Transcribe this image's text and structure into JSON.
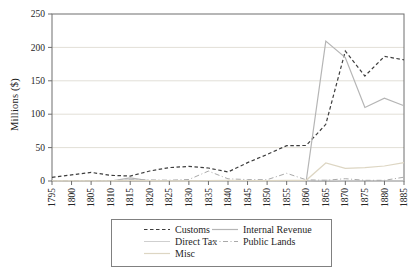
{
  "chart_data": {
    "type": "line",
    "title": "",
    "xlabel": "",
    "ylabel": "Millions ($)",
    "ylim": [
      0,
      250
    ],
    "y_ticks": [
      0,
      50,
      100,
      150,
      200,
      250
    ],
    "x": [
      1795,
      1800,
      1805,
      1810,
      1815,
      1820,
      1825,
      1830,
      1835,
      1840,
      1845,
      1850,
      1855,
      1860,
      1865,
      1870,
      1875,
      1880,
      1885
    ],
    "grid": "horizontal-light",
    "legend_position": "bottom-boxed",
    "axis_color": "#6e6e6e",
    "grid_color": "#e2dfd7",
    "text_color": "#262626",
    "series": [
      {
        "name": "Customs",
        "color": "#3d3d3d",
        "dash": "3.5 2.5",
        "width": 1.2,
        "values": [
          5.6,
          9.1,
          12.9,
          8.6,
          7.3,
          15.0,
          20.1,
          21.9,
          19.4,
          13.5,
          27.5,
          39.7,
          53.0,
          53.2,
          84.9,
          194.5,
          157.2,
          186.5,
          181.5
        ]
      },
      {
        "name": "Internal Revenue",
        "color": "#b5b5b5",
        "dash": "",
        "width": 1.2,
        "values": [
          0.3,
          0.8,
          0,
          0,
          4.7,
          0.1,
          0,
          0,
          0,
          0,
          0,
          0,
          0,
          0,
          209.5,
          184.9,
          110.0,
          124.0,
          112.5
        ]
      },
      {
        "name": "Direct Tax",
        "color": "#cfcfcf",
        "dash": "",
        "width": 1,
        "values": [
          0,
          0.7,
          0.2,
          0,
          2.2,
          0.1,
          0,
          0,
          0,
          0,
          0,
          0,
          0,
          0,
          1.2,
          0.2,
          0.1,
          0,
          0
        ]
      },
      {
        "name": "Public Lands",
        "color": "#a9a9a9",
        "dash": "5 2.5 1 2.5",
        "width": 1,
        "values": [
          0,
          0.4,
          0.5,
          0.7,
          1.3,
          1.6,
          1.2,
          2.3,
          14.8,
          3.3,
          2.1,
          1.9,
          11.5,
          1.8,
          1.0,
          3.4,
          1.0,
          1.0,
          5.7
        ]
      },
      {
        "name": "Misc",
        "color": "#ddd6c3",
        "dash": "",
        "width": 1.2,
        "values": [
          0.1,
          0.1,
          0.1,
          0.2,
          0.7,
          0.5,
          0.2,
          0.1,
          0.8,
          1.1,
          0.7,
          0.6,
          0.9,
          1.1,
          27.0,
          19.0,
          20.0,
          22.5,
          27.5
        ]
      }
    ]
  }
}
